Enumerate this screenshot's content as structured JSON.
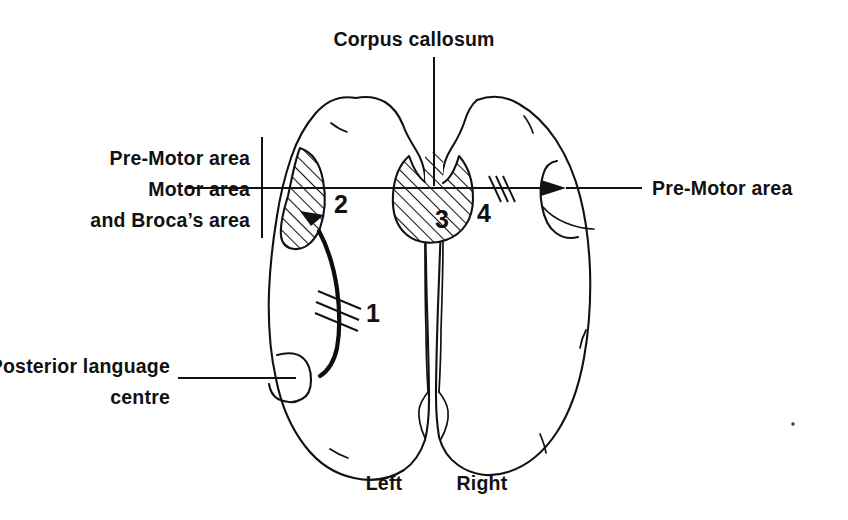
{
  "figure": {
    "title": "Corpus callosum",
    "view": "superior view of cerebral hemispheres",
    "background_color": "#ffffff",
    "ink_color": "#121212"
  },
  "labels": {
    "corpus_callosum": "Corpus callosum",
    "left_bracket": {
      "line1": "Pre-Motor area",
      "line2": "Motor area",
      "line3": "and Broca’s area"
    },
    "posterior_language": {
      "line1": "Posterior language",
      "line2": "centre"
    },
    "right_premotor": "Pre-Motor area",
    "hemisphere_left": "Left",
    "hemisphere_right": "Right"
  },
  "markers": [
    {
      "id": "marker-1",
      "number": "1",
      "describes": "arcuate fasciculus lesion in left hemisphere",
      "x": 373,
      "y": 322
    },
    {
      "id": "marker-2",
      "number": "2",
      "describes": "left motor / Broca's area hatched region",
      "x": 341,
      "y": 213
    },
    {
      "id": "marker-3",
      "number": "3",
      "describes": "corpus callosum hatched region",
      "x": 442,
      "y": 228
    },
    {
      "id": "marker-4",
      "number": "4",
      "describes": "callosal fibre lesion on transfer pathway",
      "x": 484,
      "y": 222
    }
  ],
  "regions": {
    "left_motor_area": {
      "name": "Motor and Broca's area",
      "shading": "diagonal hatching"
    },
    "corpus_callosum_body": {
      "name": "Corpus callosum",
      "shading": "diagonal hatching"
    },
    "posterior_language_centre": {
      "name": "Posterior language centre",
      "shading": "none"
    },
    "right_premotor_area": {
      "name": "Pre-Motor area",
      "shading": "none"
    }
  }
}
